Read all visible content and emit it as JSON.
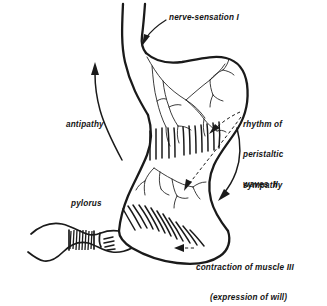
{
  "figure": {
    "background_color": "#ffffff",
    "ink_color": "#1a1a1a"
  },
  "labels": {
    "nerve_sensation": "nerve-sensation I",
    "rhythm_line_1": "rhythm of",
    "rhythm_line_2": "peristaltic",
    "rhythm_line_3": "waves  II",
    "antipathy": "antipathy",
    "sympathy": "sympathy",
    "pylorus": "pylorus",
    "contraction_line_1": "contraction of muscle III",
    "contraction_line_2": "(expression of will)"
  },
  "parts": {
    "esophagus": "esophagus",
    "fundus": "fundus",
    "greater_curvature": "greater-curvature",
    "lesser_curvature": "lesser-curvature",
    "antrum": "antrum",
    "pyloric_sphincter": "pyloric-sphincter",
    "duodenum": "duodenum",
    "vagus_nerve_plexus": "vagus-nerve-plexus",
    "peristaltic_hatching_upper": "peristaltic-hatching-upper",
    "peristaltic_hatching_lower": "peristaltic-hatching-lower"
  },
  "annotations": {
    "antipathy_arrow_direction": "upward",
    "sympathy_arrow_direction": "downward",
    "nerve_sensation_arrow_direction": "down-left into esophagus",
    "rhythm_leader_count": "2",
    "contraction_leader_direction": "left"
  }
}
